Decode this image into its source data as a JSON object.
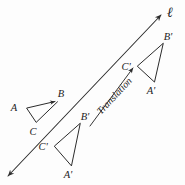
{
  "figure": {
    "kind": "geometry-translation-diagram",
    "background_color": "#fdfdfd",
    "ink_color": "#2b2b2b",
    "line": {
      "name": "line-ell",
      "label": "ℓ",
      "label_position": {
        "x": 170,
        "y": 17
      },
      "double_headed": true,
      "start": {
        "x": 6,
        "y": 178
      },
      "end": {
        "x": 163,
        "y": 13
      }
    },
    "translation_vector": {
      "label": "Translation",
      "tail": {
        "x": 90,
        "y": 126
      },
      "head": {
        "x": 134,
        "y": 67
      },
      "label_rotation_deg": -47
    },
    "triangles": [
      {
        "name": "triangle-abc",
        "role": "pre-image",
        "vertices": [
          {
            "label": "A",
            "x": 27,
            "y": 108,
            "label_x": 14,
            "label_y": 110
          },
          {
            "label": "B",
            "x": 57,
            "y": 101,
            "label_x": 61,
            "label_y": 97
          },
          {
            "label": "C",
            "x": 36,
            "y": 122,
            "label_x": 33,
            "label_y": 134
          }
        ]
      },
      {
        "name": "triangle-a-prime-b-prime-c-prime-middle",
        "role": "image-1",
        "vertices": [
          {
            "label": "A'",
            "x": 71,
            "y": 166,
            "label_x": 66,
            "label_y": 177
          },
          {
            "label": "B'",
            "x": 80,
            "y": 123,
            "label_x": 83,
            "label_y": 119
          },
          {
            "label": "C'",
            "x": 54,
            "y": 146,
            "label_x": 42,
            "label_y": 150
          }
        ]
      },
      {
        "name": "triangle-a-prime-b-prime-c-prime-upper",
        "role": "image-2",
        "vertices": [
          {
            "label": "A'",
            "x": 154,
            "y": 82,
            "label_x": 149,
            "label_y": 93
          },
          {
            "label": "B'",
            "x": 163,
            "y": 43,
            "label_x": 166,
            "label_y": 39
          },
          {
            "label": "C'",
            "x": 137,
            "y": 66,
            "label_x": 125,
            "label_y": 70
          }
        ]
      }
    ]
  }
}
